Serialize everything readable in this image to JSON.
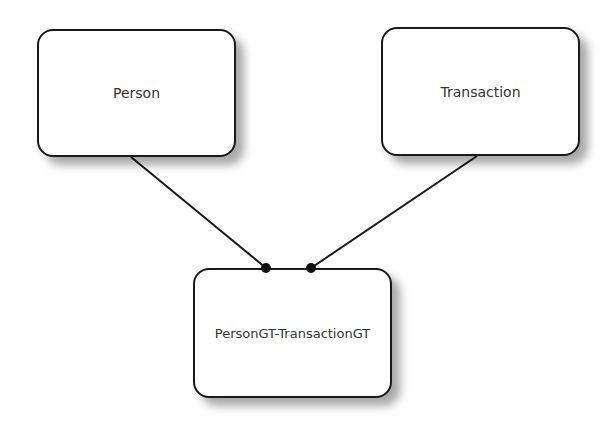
{
  "diagram": {
    "nodes": [
      {
        "id": "person",
        "label": "Person"
      },
      {
        "id": "transaction",
        "label": "Transaction"
      },
      {
        "id": "link",
        "label": "PersonGT-TransactionGT"
      }
    ],
    "edges": [
      {
        "from": "person",
        "to": "link",
        "end": "dot"
      },
      {
        "from": "transaction",
        "to": "link",
        "end": "dot"
      }
    ],
    "colors": {
      "stroke": "#1a1a1a",
      "fill": "#ffffff",
      "text": "#333333"
    }
  }
}
